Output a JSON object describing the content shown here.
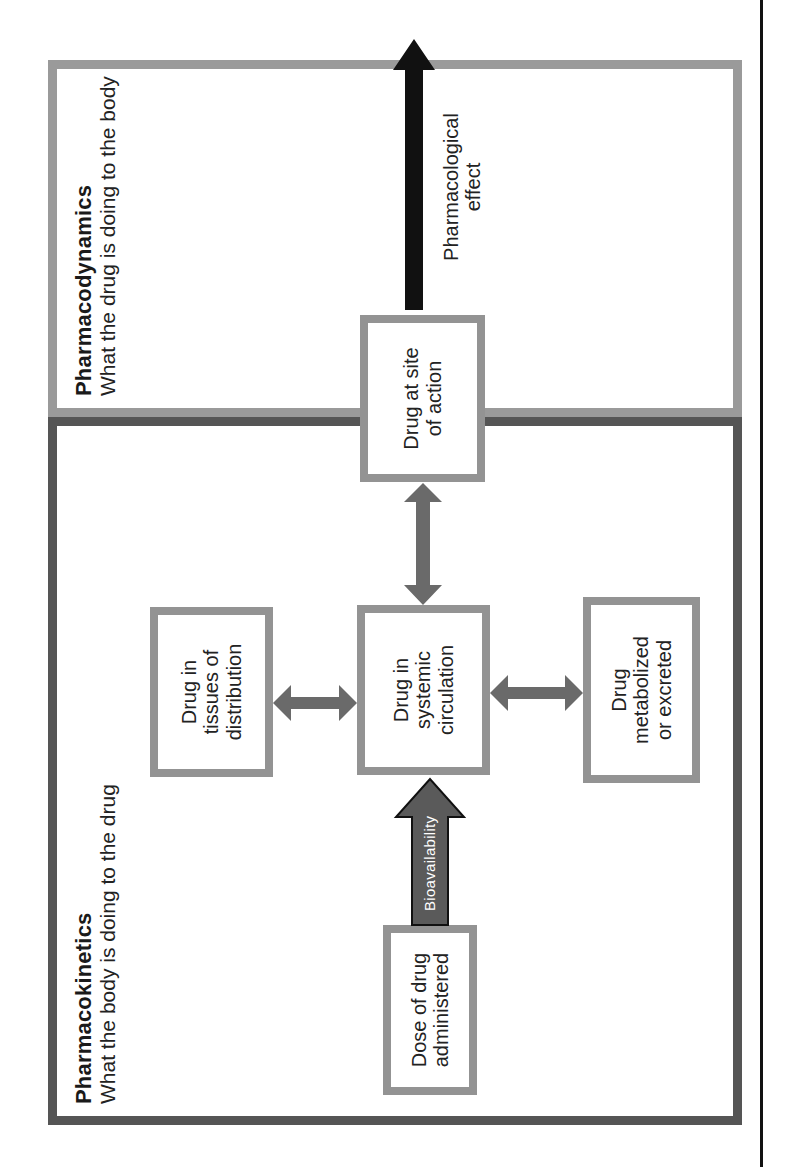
{
  "orientation": "rotated-90-ccw",
  "colors": {
    "pk_border": "#555555",
    "pd_border": "#9a9a9a",
    "box_border": "#939393",
    "double_arrow": "#6a6a6a",
    "bioavailability_arrow": "#5a5a5a",
    "effect_arrow": "#111111"
  },
  "pharmacokinetics": {
    "title": "Pharmacokinetics",
    "subtitle": "What the body is doing to the drug",
    "boxes": {
      "dose": "Dose of drug\nadministered",
      "tissues": "Drug in\ntissues of\ndistribution",
      "systemic": "Drug in\nsystemic\ncirculation",
      "metabolized": "Drug\nmetabolized\nor excreted"
    },
    "bioavailability_label": "Bioavailability"
  },
  "pharmacodynamics": {
    "title": "Pharmacodynamics",
    "subtitle": "What the drug is doing to the body",
    "boxes": {
      "site_of_action": "Drug at site\nof action"
    },
    "effect_label": "Pharmacological\neffect"
  }
}
